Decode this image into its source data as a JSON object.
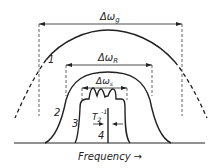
{
  "diagram": {
    "colors": {
      "stroke": "#222222",
      "background": "#ffffff"
    },
    "labels": {
      "delta_g": "Δω",
      "delta_g_sub": "g",
      "delta_r": "Δω",
      "delta_r_sub": "R",
      "delta_s": "Δω",
      "delta_s_sub": "s",
      "t2": "T",
      "t2_sub": "2",
      "t2_sup": "-1",
      "curve1": "1",
      "curve2": "2",
      "curve3": "3",
      "curve4": "4",
      "xaxis": "Frequency",
      "xaxis_arrow": "→"
    }
  }
}
